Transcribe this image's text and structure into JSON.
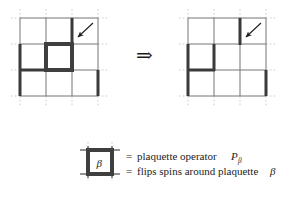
{
  "figure": {
    "implication_symbol": "⇒",
    "equals_symbol": "=",
    "beta_symbol": "β",
    "p_symbol": "P"
  },
  "colors": {
    "background": "#ffffff",
    "thin_lattice_line": "#6e6e6e",
    "thin_lattice_line_light": "#8c8c8c",
    "bold_spin_line": "#3a3a3a",
    "dotted_guide": "#c9c9c9",
    "plaquette_fill": "#ffffff",
    "plaquette_border": "#4a4a4a",
    "text": "#1b1b1b",
    "arrow_marker": "#1f1f1f"
  },
  "left_lattice": {
    "label": "before-plaquette-operator",
    "description": "4x4 lattice with bold excited bonds and one highlighted plaquette",
    "grid": {
      "x_positions": [
        20,
        46,
        72,
        98
      ],
      "y_positions": [
        18,
        44,
        70,
        96
      ],
      "dotted_overhang": 9
    },
    "bold_bonds": [
      {
        "name": "bond-left-vertical-upper",
        "x1": 20,
        "y1": 44,
        "x2": 20,
        "y2": 70
      },
      {
        "name": "bond-left-vertical-lower",
        "x1": 20,
        "y1": 70,
        "x2": 20,
        "y2": 96
      },
      {
        "name": "bond-bottom-horizontal-left",
        "x1": 20,
        "y1": 70,
        "x2": 46,
        "y2": 70
      },
      {
        "name": "bond-plaquette-top",
        "x1": 46,
        "y1": 44,
        "x2": 72,
        "y2": 44
      },
      {
        "name": "bond-plaquette-bottom",
        "x1": 46,
        "y1": 70,
        "x2": 72,
        "y2": 70
      },
      {
        "name": "bond-plaquette-right",
        "x1": 72,
        "y1": 44,
        "x2": 72,
        "y2": 70
      },
      {
        "name": "bond-upper-right-vertical",
        "x1": 72,
        "y1": 18,
        "x2": 72,
        "y2": 44
      },
      {
        "name": "bond-far-right-vertical-lower",
        "x1": 98,
        "y1": 70,
        "x2": 98,
        "y2": 96
      }
    ],
    "plaquette_highlight": {
      "x": 46,
      "y": 44,
      "w": 26,
      "h": 26
    },
    "pointer_arrow": {
      "name": "plaquette-pointer-arrow",
      "x1": 92,
      "y1": 24,
      "x2": 76,
      "y2": 38
    }
  },
  "right_lattice": {
    "label": "after-plaquette-operator",
    "description": "same lattice with spins around the plaquette flipped",
    "grid": {
      "x_positions": [
        188,
        214,
        240,
        266
      ],
      "y_positions": [
        18,
        44,
        70,
        96
      ],
      "dotted_overhang": 9
    },
    "bold_bonds": [
      {
        "name": "bond-left-vertical-upper",
        "x1": 188,
        "y1": 44,
        "x2": 188,
        "y2": 70
      },
      {
        "name": "bond-left-vertical-lower",
        "x1": 188,
        "y1": 70,
        "x2": 188,
        "y2": 96
      },
      {
        "name": "bond-bottom-horizontal-left",
        "x1": 188,
        "y1": 70,
        "x2": 214,
        "y2": 70
      },
      {
        "name": "bond-middle-vertical",
        "x1": 214,
        "y1": 44,
        "x2": 214,
        "y2": 70
      },
      {
        "name": "bond-upper-right-vertical",
        "x1": 240,
        "y1": 18,
        "x2": 240,
        "y2": 44
      },
      {
        "name": "bond-far-right-vertical-lower",
        "x1": 266,
        "y1": 70,
        "x2": 266,
        "y2": 96
      }
    ],
    "pointer_arrow": {
      "name": "flipped-site-pointer-arrow",
      "x1": 260,
      "y1": 24,
      "x2": 244,
      "y2": 38
    }
  },
  "legend": {
    "name": "plaquette-legend",
    "icon": {
      "name": "plaquette-operator-icon",
      "x": 82,
      "y": 148,
      "size": 28,
      "beta_label": "β"
    },
    "lines": [
      {
        "name": "legend-line-operator",
        "prefix": "=",
        "text": "plaquette operator",
        "math_base": "P",
        "math_sub": "β"
      },
      {
        "name": "legend-line-action",
        "prefix": "=",
        "text": "flips spins around plaquette",
        "math_base": "",
        "math_sub": "β"
      }
    ]
  }
}
